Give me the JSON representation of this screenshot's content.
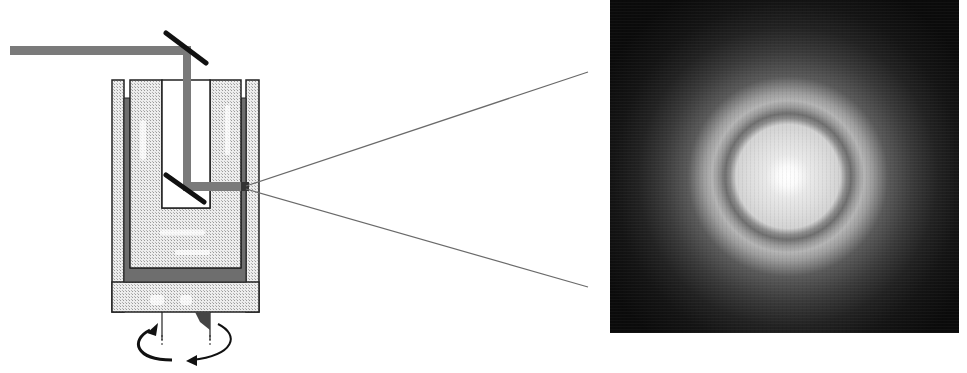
{
  "figure": {
    "type": "scientific-diagram",
    "left_panel": {
      "subject": "rotating cylindrical sample cell with laser beam path",
      "elements": [
        "laser-beam",
        "top-mirror",
        "bottom-mirror",
        "cylinder-cell",
        "rotation-arrow",
        "scattered-rays"
      ]
    },
    "right_panel": {
      "subject": "photograph of light-scattering ring pattern",
      "elements": [
        "bright-center-spot",
        "inner-disc",
        "dark-ring",
        "bright-ring",
        "diffuse-halo"
      ]
    },
    "colors": {
      "beam": "#7a7a7a",
      "mirror": "#111111",
      "cell_fill": "#e6e6e6",
      "lining": "#6e6e6e",
      "ray": "#6a6a6a",
      "photo_background": "#0c0c0c"
    },
    "captions": {
      "left": "",
      "right": ""
    }
  }
}
